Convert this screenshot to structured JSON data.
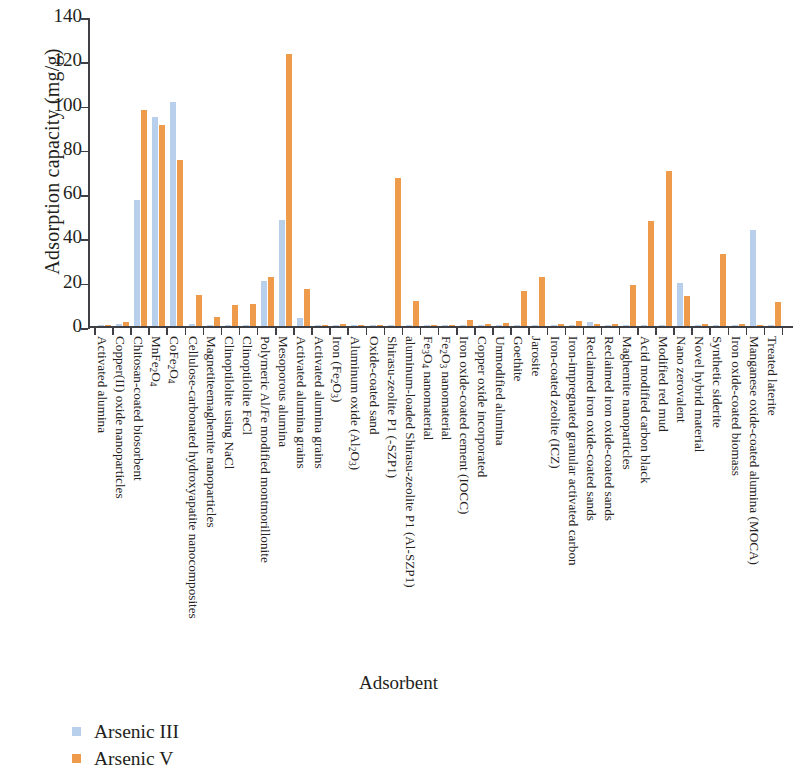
{
  "chart_data": {
    "type": "bar",
    "title": "",
    "xlabel": "Adsorbent",
    "ylabel": "Adsorption capacity (mg/g)",
    "ylim": [
      0,
      140
    ],
    "yticks": [
      0,
      20,
      40,
      60,
      80,
      100,
      120,
      140
    ],
    "grid": false,
    "legend_position": "bottom-left",
    "colors": {
      "arsenic_iii": "#b8d0ec",
      "arsenic_v": "#ee9c4c",
      "axis": "#3f3f46"
    },
    "categories": [
      "Activated alumina",
      "Copper(II) oxide nanoparticles",
      "Chitosan-coated biosorbent",
      "MnFe2O4",
      "CoFe2O4",
      "Cellulose-carbonated hydroxyapatite nanocomposites",
      "Magnetiteemaghemite nanoparticles",
      "Clinoptilolite using NaCl",
      "Clinoptilolite FeCl",
      "Polymeric Al/Fe modified montmorillonite",
      "Mesoporous alumina",
      "Activated alumina grains",
      "Activated alumina grains",
      "Iron (Fe2O3)",
      "Aluminum oxide (Al2O3)",
      "Oxide-coated sand",
      "Shirasu-zeolite P1 (-SZP1)",
      "aluminum-loaded Shirasu-zeolite P1 (Al-SZP1)",
      "Fe3O4 nanomaterial",
      "Fe2O3 nanomaterial",
      "Iron oxide-coated cement (IOCC)",
      "Copper oxide incorporated",
      "Unmodified alumina",
      "Goethite",
      "Jarosite",
      "Iron-coated zeolite (ICZ)",
      "Iron-impregnated granular activated carbon",
      "Reclaimed iron oxide-coated sands",
      "Reclaimed iron oxide-coated sands",
      "Maghemite nanoparticles",
      "Acid modified carbon black",
      "Modified red mud",
      "Nano zerovalent",
      "Novel hybrid material",
      "Synthetic siderite",
      "Iron oxide-coated biomass",
      "Manganese oxide-coated alumina (MOCA)",
      "Treated laterite"
    ],
    "categories_html": [
      "Activated alumina",
      "Copper(II) oxide nanoparticles",
      "Chitosan-coated biosorbent",
      "MnFe<sub>2</sub>O<sub>4</sub>",
      "CoFe<sub>2</sub>O<sub>4</sub>",
      "Cellulose-carbonated hydroxyapatite nanocomposites",
      "Magnetiteemaghemite nanoparticles",
      "Clinoptilolite using NaCl",
      "Clinoptilolite FeCl",
      "Polymeric Al/Fe modified montmorillonite",
      "Mesoporous alumina",
      "Activated alumina grains",
      "Activated alumina grains",
      "Iron (Fe<sub>2</sub>O<sub>3</sub>)",
      "Aluminum oxide (Al<sub>2</sub>O<sub>3</sub>)",
      "Oxide-coated sand",
      "Shirasu-zeolite P1 (-SZP1)",
      "aluminum-loaded Shirasu-zeolite P1 (Al-SZP1)",
      "Fe<sub>3</sub>O<sub>4</sub> nanomaterial",
      "Fe<sub>2</sub>O<sub>3</sub> nanomaterial",
      "Iron oxide-coated cement (IOCC)",
      "Copper oxide incorporated",
      "Unmodified alumina",
      "Goethite",
      "Jarosite",
      "Iron-coated zeolite (ICZ)",
      "Iron-impregnated granular activated carbon",
      "Reclaimed iron oxide-coated sands",
      "Reclaimed iron oxide-coated sands",
      "Maghemite nanoparticles",
      "Acid modified carbon black",
      "Modified red mud",
      "Nano zerovalent",
      "Novel hybrid material",
      "Synthetic siderite",
      "Iron oxide-coated biomass",
      "Manganese oxide-coated alumina (MOCA)",
      "Treated laterite"
    ],
    "series": [
      {
        "name": "Arsenic III",
        "color": "#b8d0ec",
        "values": [
          0.6,
          1.1,
          57.0,
          94.5,
          101.0,
          0.8,
          0.5,
          0.4,
          0.6,
          20.5,
          48.0,
          3.5,
          0.5,
          0.4,
          0.3,
          0.4,
          0.5,
          0.4,
          0.4,
          0.3,
          0.4,
          0.6,
          0.5,
          0.4,
          0.4,
          0.5,
          0.6,
          1.8,
          0.6,
          0.5,
          0.4,
          0.5,
          19.5,
          0.5,
          0.6,
          0.5,
          43.5,
          0.5
        ]
      },
      {
        "name": "Arsenic V",
        "color": "#ee9c4c",
        "values": [
          0.5,
          2.0,
          97.5,
          91.0,
          75.0,
          13.8,
          4.0,
          9.3,
          9.8,
          22.3,
          123.0,
          16.5,
          0.6,
          1.0,
          0.5,
          0.6,
          67.0,
          11.5,
          0.6,
          0.5,
          2.8,
          0.8,
          1.2,
          16.0,
          22.0,
          0.9,
          2.2,
          0.8,
          0.7,
          18.3,
          47.5,
          70.0,
          13.5,
          1.0,
          32.5,
          1.1,
          0.6,
          10.8
        ]
      }
    ]
  },
  "legend": {
    "items": [
      {
        "label": "Arsenic III",
        "color": "#b8d0ec"
      },
      {
        "label": "Arsenic V",
        "color": "#ee9c4c"
      }
    ]
  },
  "axes": {
    "y_title": "Adsorption capacity (mg/g)",
    "x_title": "Adsorbent",
    "y_ticks": [
      "140",
      "120",
      "100",
      "80",
      "60",
      "40",
      "20",
      "0"
    ]
  }
}
